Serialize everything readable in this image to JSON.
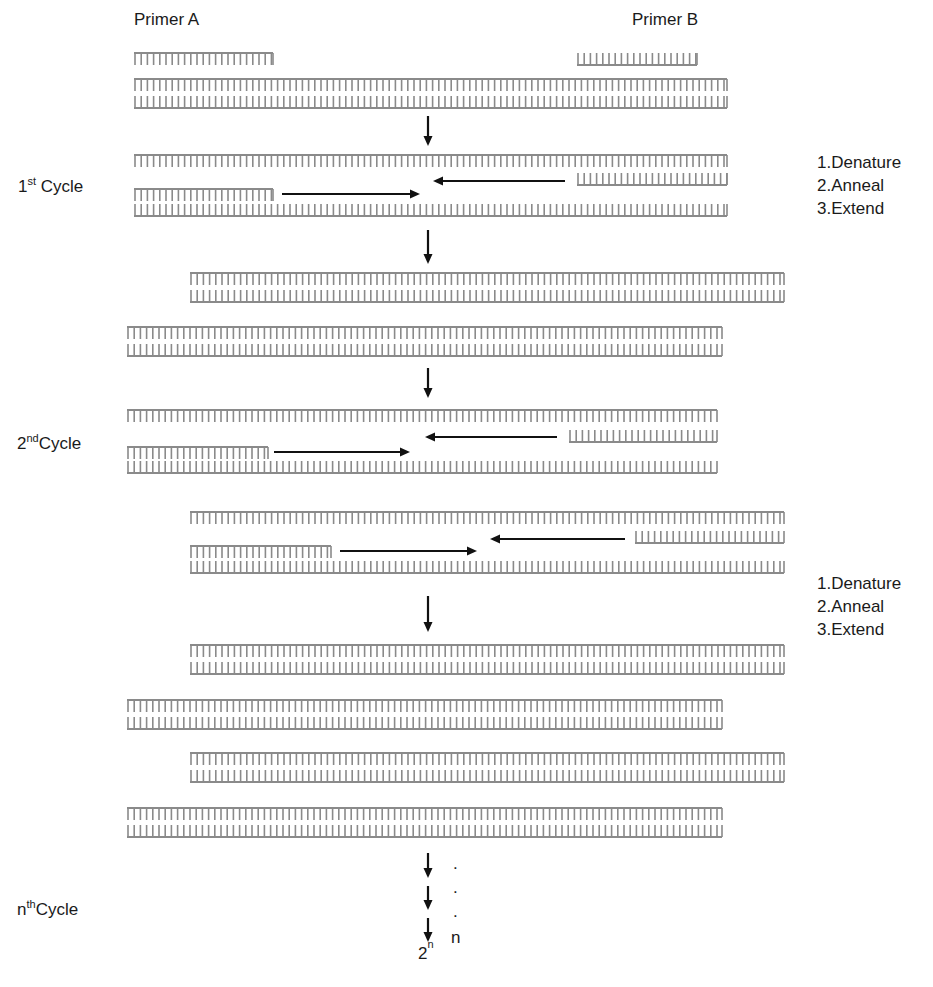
{
  "labels": {
    "primer_a": "Primer A",
    "primer_b": "Primer B",
    "cycle1": {
      "num": "1",
      "sup": "st",
      "word": " Cycle"
    },
    "cycle2": {
      "num": "2",
      "sup": "nd",
      "word": "Cycle"
    },
    "cyclen": {
      "num": "n",
      "sup": "th",
      "word": "Cycle"
    },
    "steps_1": [
      "1.Denature",
      "2.Anneal",
      "3.Extend"
    ],
    "steps_2": [
      "1.Denature",
      "2.Anneal",
      "3.Extend"
    ],
    "n_label": "n",
    "result_base": "2",
    "result_exp": "n",
    "dots": [
      ".",
      ".",
      "."
    ]
  },
  "colors": {
    "strand": "#8a8a8a",
    "arrow": "#111111"
  }
}
